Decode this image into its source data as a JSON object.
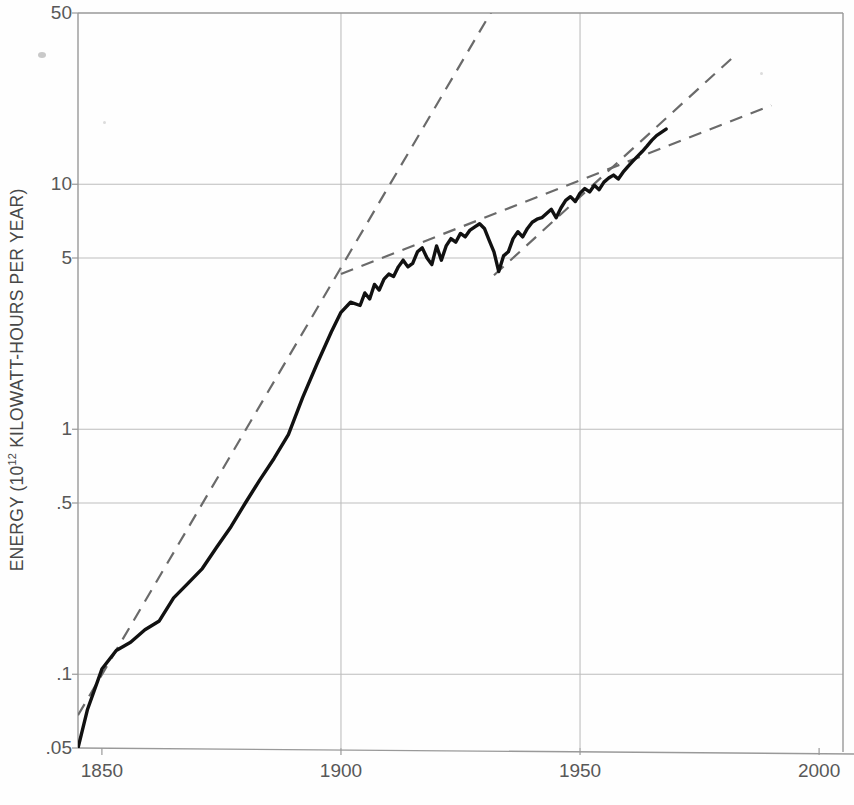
{
  "chart_data": {
    "type": "line",
    "title": "",
    "xlabel": "",
    "ylabel": "ENERGY (10¹² KILOWATT-HOURS PER YEAR)",
    "ylabel_prefix": "ENERGY (10",
    "ylabel_exponent": "12",
    "ylabel_suffix": " KILOWATT-HOURS PER YEAR)",
    "yscale": "log",
    "ylim": [
      0.05,
      50
    ],
    "xlim": [
      1845,
      2005
    ],
    "grid": true,
    "legend": "none",
    "ytick_labels": [
      "50",
      "10",
      "5",
      "1",
      ".5",
      ".1",
      ".05"
    ],
    "ytick_values": [
      50,
      10,
      5,
      1,
      0.5,
      0.1,
      0.05
    ],
    "xtick_labels": [
      "1850",
      "1900",
      "1950",
      "2000"
    ],
    "xtick_values": [
      1850,
      1900,
      1950,
      2000
    ],
    "gridlines_y": [
      10,
      5,
      1,
      0.5,
      0.1
    ],
    "gridlines_x": [
      1900,
      1950
    ],
    "series": [
      {
        "name": "World energy consumption",
        "style": "solid",
        "color": "#111111",
        "x": [
          1845,
          1847,
          1850,
          1853,
          1856,
          1859,
          1862,
          1865,
          1868,
          1871,
          1874,
          1877,
          1880,
          1883,
          1886,
          1889,
          1892,
          1895,
          1898,
          1900,
          1902,
          1904,
          1905,
          1906,
          1907,
          1908,
          1909,
          1910,
          1911,
          1912,
          1913,
          1914,
          1915,
          1916,
          1917,
          1918,
          1919,
          1920,
          1921,
          1922,
          1923,
          1924,
          1925,
          1926,
          1927,
          1928,
          1929,
          1930,
          1931,
          1932,
          1933,
          1934,
          1935,
          1936,
          1937,
          1938,
          1939,
          1940,
          1941,
          1942,
          1943,
          1944,
          1945,
          1946,
          1947,
          1948,
          1949,
          1950,
          1951,
          1952,
          1953,
          1954,
          1955,
          1956,
          1957,
          1958,
          1959,
          1960,
          1961,
          1962,
          1963,
          1964,
          1965,
          1966,
          1968
        ],
        "y": [
          0.05,
          0.072,
          0.105,
          0.125,
          0.135,
          0.152,
          0.165,
          0.205,
          0.235,
          0.27,
          0.33,
          0.4,
          0.5,
          0.62,
          0.76,
          0.95,
          1.35,
          1.85,
          2.5,
          3.0,
          3.3,
          3.2,
          3.6,
          3.4,
          3.9,
          3.7,
          4.1,
          4.3,
          4.2,
          4.6,
          4.9,
          4.6,
          4.75,
          5.3,
          5.5,
          5.0,
          4.7,
          5.6,
          4.9,
          5.6,
          6.0,
          5.8,
          6.3,
          6.1,
          6.5,
          6.7,
          6.9,
          6.6,
          5.9,
          5.3,
          4.4,
          5.1,
          5.3,
          6.0,
          6.4,
          6.1,
          6.6,
          7.0,
          7.2,
          7.3,
          7.6,
          7.9,
          7.3,
          8.0,
          8.6,
          8.9,
          8.5,
          9.2,
          9.6,
          9.3,
          9.9,
          9.5,
          10.2,
          10.6,
          10.9,
          10.5,
          11.2,
          11.8,
          12.4,
          13.0,
          13.6,
          14.3,
          15.1,
          15.8,
          16.8
        ]
      }
    ],
    "trendlines": [
      {
        "name": "early-growth-trend",
        "style": "dashed",
        "color": "#6a6a6a",
        "x": [
          1845,
          1933
        ],
        "y": [
          0.068,
          57.0
        ]
      },
      {
        "name": "middle-growth-trend",
        "style": "dashed",
        "color": "#6a6a6a",
        "x": [
          1900,
          1990
        ],
        "y": [
          4.3,
          21.0
        ]
      },
      {
        "name": "late-growth-trend",
        "style": "dashed",
        "color": "#6a6a6a",
        "x": [
          1932,
          1982
        ],
        "y": [
          4.25,
          33.0
        ]
      }
    ]
  },
  "figure": {
    "background_color": "#fefefe",
    "axis_color": "#999999",
    "grid_color": "#bdbdbd",
    "text_color": "#585858"
  }
}
